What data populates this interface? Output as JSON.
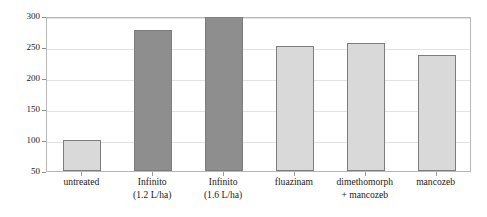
{
  "chart_data": {
    "type": "bar",
    "title": "",
    "subtitle": "",
    "xlabel": "",
    "ylabel": "Relative yield (%)",
    "ylim": [
      50,
      300
    ],
    "ytick_values": [
      50,
      100,
      150,
      200,
      250,
      300
    ],
    "ytick_labels": [
      "50",
      "100",
      "150",
      "200",
      "250",
      "300"
    ],
    "grid": true,
    "legend": "none",
    "categories": [
      "untreated",
      "Infinito (1.2 L/ha)",
      "Infinito (1.6 L/ha)",
      "fluazinam",
      "dimethomorph + mancozeb",
      "mancozeb"
    ],
    "category_lines": [
      [
        "untreated",
        ""
      ],
      [
        "Infinito",
        "(1.2 L/ha)"
      ],
      [
        "Infinito",
        "(1.6 L/ha)"
      ],
      [
        "fluazinam",
        ""
      ],
      [
        "dimethomorph",
        "+ mancozeb"
      ],
      [
        "mancozeb",
        ""
      ]
    ],
    "values": [
      100,
      277,
      298,
      252,
      257,
      237
    ],
    "bar_colors": [
      "#d9d9d9",
      "#8e8e8e",
      "#8e8e8e",
      "#d9d9d9",
      "#d9d9d9",
      "#d9d9d9"
    ],
    "bar_edge_color": "#7d7d7d",
    "grid_color": "#e2e2e2",
    "axis_color": "#b8b8b8",
    "text_color": "#1a1a1a",
    "background_color": "#ffffff"
  }
}
